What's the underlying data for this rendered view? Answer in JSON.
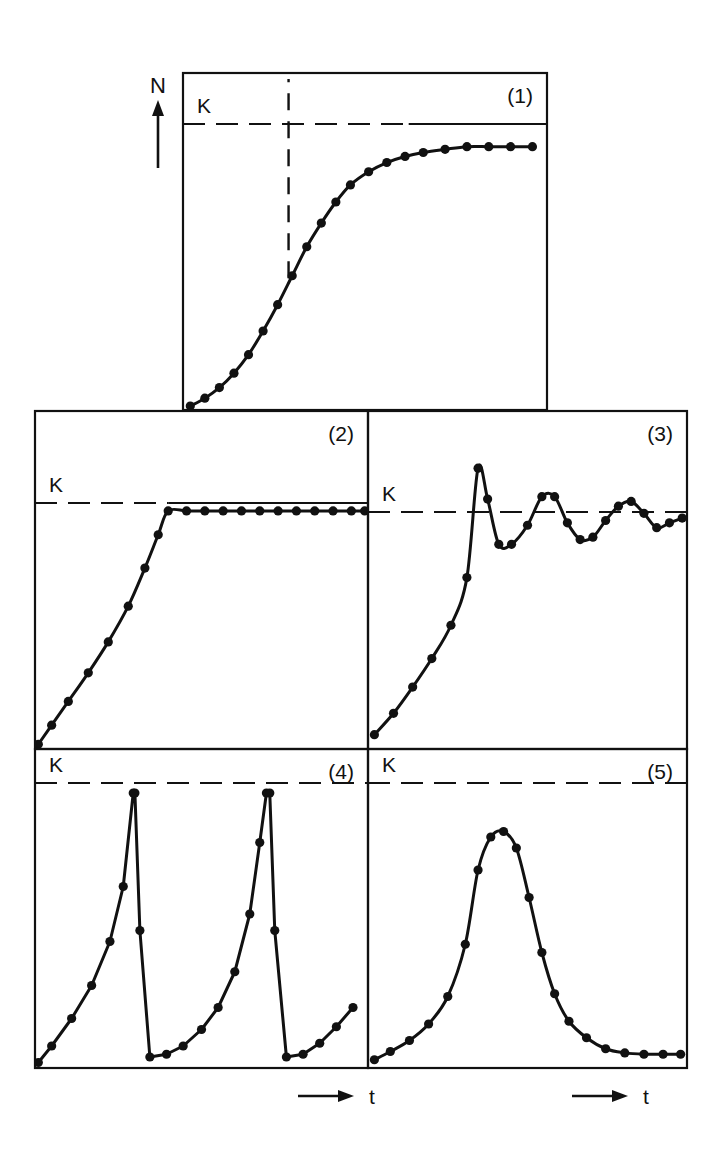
{
  "figure": {
    "axis_y_label": "N",
    "axis_x_label": "t",
    "carrying_capacity_label": "K",
    "panel_labels": [
      "(1)",
      "(2)",
      "(3)",
      "(4)",
      "(5)"
    ],
    "background_color": "#ffffff",
    "ink_color": "#111111"
  },
  "chart_data": {
    "type": "line",
    "xlabel": "t",
    "ylabel": "N",
    "grid": false,
    "legend_position": "none",
    "shared_annotations": {
      "carrying_capacity_label": "K",
      "carrying_capacity_value": 1.0,
      "k_line_style": "dashed"
    },
    "panels": [
      {
        "id": "1",
        "label": "(1)",
        "name": "logistic-sigmoid-growth",
        "description": "Sigmoid logistic growth approaching K asymptotically",
        "xlim": [
          0,
          1
        ],
        "ylim": [
          0,
          1.28
        ],
        "k_value": 1.0,
        "k_line_style": "dashed-left-solid-right",
        "inflection_marker": {
          "style": "dashed-vertical",
          "x": 0.29,
          "y_from": 0.5,
          "y_to": 1.28
        },
        "x": [
          0.02,
          0.06,
          0.1,
          0.14,
          0.18,
          0.22,
          0.26,
          0.3,
          0.34,
          0.38,
          0.42,
          0.46,
          0.51,
          0.56,
          0.61,
          0.66,
          0.72,
          0.78,
          0.84,
          0.9,
          0.96
        ],
        "y": [
          0.015,
          0.045,
          0.085,
          0.14,
          0.21,
          0.3,
          0.4,
          0.51,
          0.62,
          0.71,
          0.79,
          0.855,
          0.905,
          0.94,
          0.963,
          0.978,
          0.99,
          1.0,
          1.0,
          1.0,
          1.0
        ]
      },
      {
        "id": "2",
        "label": "(2)",
        "name": "exponential-abrupt-plateau",
        "description": "J-shaped exponential rise with abrupt arrest at K",
        "xlim": [
          0,
          1
        ],
        "ylim": [
          0,
          1.42
        ],
        "k_value": 1.0,
        "k_line_style": "dashed-left-solid-right",
        "x": [
          0.01,
          0.05,
          0.1,
          0.16,
          0.22,
          0.28,
          0.33,
          0.37,
          0.4,
          0.455,
          0.51,
          0.565,
          0.62,
          0.675,
          0.73,
          0.785,
          0.84,
          0.895,
          0.95,
          0.99
        ],
        "y": [
          0.02,
          0.1,
          0.2,
          0.32,
          0.45,
          0.6,
          0.76,
          0.9,
          1.0,
          1.0,
          1.0,
          1.0,
          1.0,
          1.0,
          1.0,
          1.0,
          1.0,
          1.0,
          1.0,
          1.0
        ]
      },
      {
        "id": "3",
        "label": "(3)",
        "name": "damped-oscillation-overshoot",
        "description": "Exponential rise overshooting K then damped oscillation converging on K",
        "xlim": [
          0,
          1
        ],
        "ylim": [
          0,
          1.42
        ],
        "k_value": 1.0,
        "k_line_style": "dashed",
        "x": [
          0.02,
          0.08,
          0.14,
          0.2,
          0.26,
          0.31,
          0.345,
          0.375,
          0.41,
          0.45,
          0.5,
          0.545,
          0.585,
          0.625,
          0.665,
          0.705,
          0.745,
          0.785,
          0.825,
          0.865,
          0.905,
          0.945,
          0.985
        ],
        "y": [
          0.06,
          0.15,
          0.26,
          0.38,
          0.52,
          0.72,
          1.18,
          1.05,
          0.86,
          0.86,
          0.94,
          1.06,
          1.06,
          0.95,
          0.88,
          0.89,
          0.96,
          1.02,
          1.04,
          0.99,
          0.93,
          0.95,
          0.97
        ]
      },
      {
        "id": "4",
        "label": "(4)",
        "name": "boom-and-bust-cycles",
        "description": "Repeated exponential booms to K followed by vertical crashes (sawtooth)",
        "xlim": [
          0,
          1
        ],
        "ylim": [
          0,
          1.16
        ],
        "k_value": 1.0,
        "k_line_style": "dashed",
        "cycles": 2,
        "x": [
          0.01,
          0.05,
          0.11,
          0.17,
          0.225,
          0.265,
          0.295,
          0.3,
          0.315,
          0.345,
          0.395,
          0.445,
          0.5,
          0.55,
          0.6,
          0.645,
          0.675,
          0.695,
          0.705,
          0.72,
          0.755,
          0.805,
          0.855,
          0.905,
          0.955
        ],
        "y": [
          0.02,
          0.08,
          0.18,
          0.3,
          0.46,
          0.66,
          1.0,
          1.0,
          0.5,
          0.04,
          0.05,
          0.08,
          0.14,
          0.22,
          0.35,
          0.56,
          0.82,
          1.0,
          1.0,
          0.5,
          0.04,
          0.05,
          0.09,
          0.15,
          0.22
        ]
      },
      {
        "id": "5",
        "label": "(5)",
        "name": "single-irruption-crash",
        "description": "Single irruptive peak below K followed by decline to low level",
        "xlim": [
          0,
          1
        ],
        "ylim": [
          0,
          1.16
        ],
        "k_value": 1.0,
        "k_line_style": "dashed",
        "x": [
          0.02,
          0.07,
          0.13,
          0.19,
          0.25,
          0.305,
          0.345,
          0.385,
          0.425,
          0.465,
          0.505,
          0.545,
          0.585,
          0.63,
          0.685,
          0.745,
          0.805,
          0.865,
          0.925,
          0.98
        ],
        "y": [
          0.03,
          0.06,
          0.1,
          0.16,
          0.26,
          0.45,
          0.72,
          0.84,
          0.86,
          0.8,
          0.62,
          0.42,
          0.27,
          0.17,
          0.11,
          0.07,
          0.055,
          0.05,
          0.05,
          0.05
        ]
      }
    ]
  }
}
